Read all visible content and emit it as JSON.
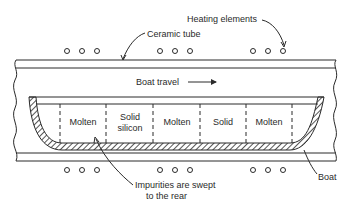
{
  "diagram": {
    "labels": {
      "heating_elements": "Heating elements",
      "ceramic_tube": "Ceramic tube",
      "boat_travel": "Boat travel",
      "boat": "Boat",
      "impurities_line1": "Impurities are swept",
      "impurities_line2": "to the rear"
    },
    "zones": [
      {
        "line1": "Molten",
        "line2": ""
      },
      {
        "line1": "Solid",
        "line2": "silicon"
      },
      {
        "line1": "Molten",
        "line2": ""
      },
      {
        "line1": "Solid",
        "line2": ""
      },
      {
        "line1": "Molten",
        "line2": ""
      }
    ],
    "heater_groups": 3,
    "heaters_per_group": 3,
    "colors": {
      "line": "#2a2a2a",
      "background": "#ffffff"
    }
  }
}
